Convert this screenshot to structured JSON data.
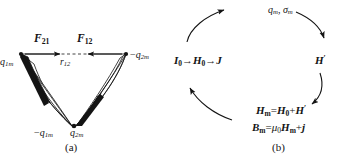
{
  "figure": {
    "background_color": "#ffffff",
    "ink_color": "#141414"
  },
  "panel_a": {
    "caption": "(a)",
    "description": "Two bar magnets with poles; mutual forces along the line joining the upper poles",
    "forces": [
      {
        "name": "force-21",
        "label_base": "F",
        "label_sub": "21",
        "full": "F21"
      },
      {
        "name": "force-12",
        "label_base": "F",
        "label_sub": "12",
        "full": "F12"
      }
    ],
    "distance": {
      "label_base": "r",
      "label_sub": "12",
      "full": "r12"
    },
    "poles": [
      {
        "name": "pole-q1m-top-left",
        "sign": "",
        "base": "q",
        "sub": "1m",
        "full": "q1m"
      },
      {
        "name": "pole-q2m-top-right",
        "sign": "−",
        "base": "q",
        "sub": "2m",
        "full": "−q2m"
      },
      {
        "name": "pole-q1m-bottom",
        "sign": "−",
        "base": "q",
        "sub": "1m",
        "full": "−q1m"
      },
      {
        "name": "pole-q2m-bottom",
        "sign": "",
        "base": "q",
        "sub": "2m",
        "full": "q2m"
      }
    ]
  },
  "panel_b": {
    "caption": "(b)",
    "description": "Cyclic four-stage magnetization relation diagram",
    "nodes": [
      {
        "name": "node-source-field",
        "position": "left",
        "segments": [
          {
            "text": "I",
            "style": "bold-italic"
          },
          {
            "text": "0",
            "style": "sub"
          },
          {
            "text": "→",
            "style": "plain"
          },
          {
            "text": "H",
            "style": "bold-italic"
          },
          {
            "text": "0",
            "style": "sub"
          },
          {
            "text": "→",
            "style": "plain"
          },
          {
            "text": "J",
            "style": "bold-italic"
          }
        ],
        "plain": "I0→H0→J"
      },
      {
        "name": "node-pole-density",
        "position": "top",
        "segments": [
          {
            "text": "q",
            "style": "italic"
          },
          {
            "text": "m",
            "style": "sub-it"
          },
          {
            "text": ", ",
            "style": "plain"
          },
          {
            "text": "σ",
            "style": "italic"
          },
          {
            "text": "m",
            "style": "sub-it"
          }
        ],
        "plain": "qm, σm"
      },
      {
        "name": "node-demag-field",
        "position": "right",
        "segments": [
          {
            "text": "H",
            "style": "bold-italic"
          },
          {
            "text": "′",
            "style": "sup"
          }
        ],
        "plain": "H′"
      },
      {
        "name": "node-total-field",
        "position": "bottom",
        "lines": [
          {
            "name": "equation-Hm",
            "segments": [
              {
                "text": "H",
                "style": "bold-italic"
              },
              {
                "text": "m",
                "style": "sub"
              },
              {
                "text": "=",
                "style": "plain"
              },
              {
                "text": "H",
                "style": "bold-italic"
              },
              {
                "text": "0",
                "style": "sub"
              },
              {
                "text": "+",
                "style": "plain"
              },
              {
                "text": "H",
                "style": "bold-italic"
              },
              {
                "text": "′",
                "style": "sup"
              }
            ],
            "plain": "Hm=H0+H′"
          },
          {
            "name": "equation-Bm",
            "segments": [
              {
                "text": "B",
                "style": "bold-italic"
              },
              {
                "text": "m",
                "style": "sub"
              },
              {
                "text": "=",
                "style": "plain"
              },
              {
                "text": "μ",
                "style": "italic"
              },
              {
                "text": "0",
                "style": "sub"
              },
              {
                "text": "H",
                "style": "bold-italic"
              },
              {
                "text": "m",
                "style": "sub"
              },
              {
                "text": "+",
                "style": "plain"
              },
              {
                "text": "j",
                "style": "bold-italic"
              }
            ],
            "plain": "Bm=μ0Hm+j"
          }
        ]
      }
    ],
    "arrows": [
      {
        "name": "arrow-bottom-left-ccw",
        "from": "node-total-field",
        "to": "node-source-field"
      },
      {
        "name": "arrow-left-top-ccw",
        "from": "node-source-field",
        "to": "node-pole-density"
      },
      {
        "name": "arrow-top-right-cw",
        "from": "node-pole-density",
        "to": "node-demag-field"
      },
      {
        "name": "arrow-right-bottom-cw",
        "from": "node-demag-field",
        "to": "node-total-field"
      }
    ]
  }
}
